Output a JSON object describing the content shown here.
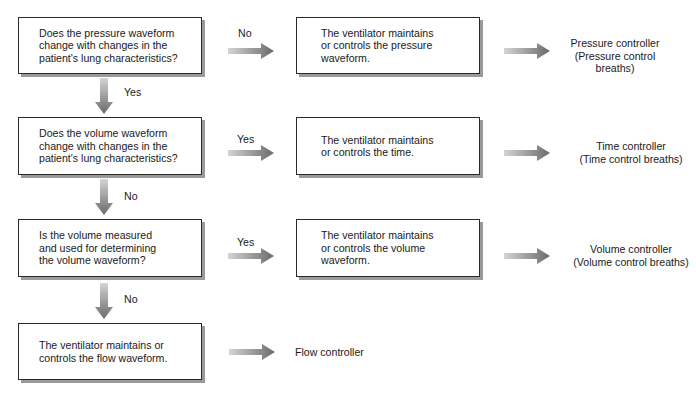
{
  "diagram": {
    "rows": [
      {
        "question": "Does the pressure waveform\nchange with changes in the\npatient's lung characteristics?",
        "branch_label": "No",
        "action": "The ventilator maintains\nor controls the pressure\nwaveform.",
        "result": "Pressure controller\n(Pressure control\nbreaths)",
        "down_label": "Yes"
      },
      {
        "question": "Does the volume waveform\nchange with changes in the\npatient's lung characteristics?",
        "branch_label": "Yes",
        "action": "The ventilator maintains\nor controls the time.",
        "result": "Time controller\n(Time control breaths)",
        "down_label": "No"
      },
      {
        "question": "Is the volume measured\nand used for determining\nthe volume waveform?",
        "branch_label": "Yes",
        "action": "The ventilator maintains\nor controls the volume\nwaveform.",
        "result": "Volume controller\n(Volume control breaths)",
        "down_label": "No"
      },
      {
        "question": "The ventilator maintains or\ncontrols the flow waveform.",
        "result": "Flow controller"
      }
    ],
    "colors": {
      "box_border": "#2a2a2a",
      "box_shadow": "#9a9a9a",
      "arrow_light": "#d0d0d0",
      "arrow_dark": "#6e6e6e",
      "text": "#1a1a1a"
    }
  }
}
